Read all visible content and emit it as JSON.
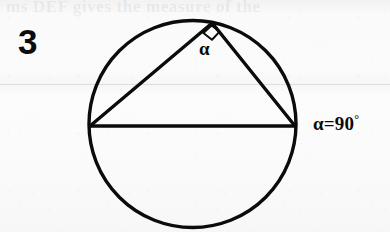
{
  "figure": {
    "number_label": "3",
    "ghost_text_top": "ms DEF gives the measure of the",
    "angle_label": "α",
    "equation": {
      "variable": "α",
      "operator": "=",
      "value": "90",
      "unit": "°",
      "full": "α=90°"
    },
    "colors": {
      "ink": "#0b0b0b",
      "paper": "#f8f8f8",
      "rule": "#787c82"
    },
    "geometry": {
      "type": "inscribed-right-triangle-in-circle",
      "circle": {
        "cx": 192.5,
        "cy": 124,
        "r": 103.5,
        "stroke_width": 3.4
      },
      "vertices": {
        "left": {
          "x": 90,
          "y": 126,
          "name": "A"
        },
        "right": {
          "x": 295,
          "y": 126,
          "name": "B"
        },
        "apex": {
          "x": 212,
          "y": 23,
          "name": "C"
        }
      },
      "diameter_chord": {
        "from": "left",
        "to": "right"
      },
      "right_angle_marker": {
        "at": "apex",
        "size": 15,
        "angle_deg": 90
      }
    }
  }
}
